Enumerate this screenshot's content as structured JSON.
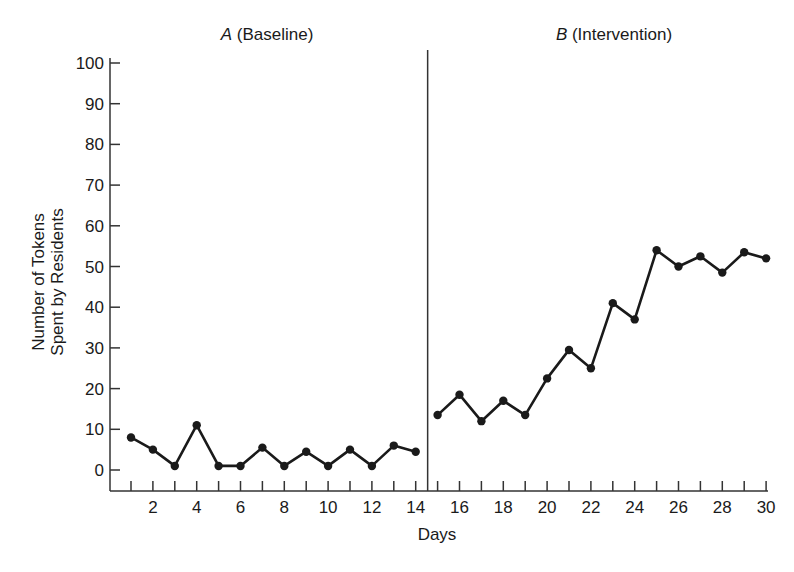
{
  "chart_data": {
    "type": "line",
    "title": "",
    "xlabel": "Days",
    "ylabel": "Number of Tokens Spent by Residents",
    "ylabel_lines": [
      "Number of Tokens",
      "Spent by Residents"
    ],
    "ylim": [
      0,
      100
    ],
    "xlim": [
      0,
      30
    ],
    "yticks": [
      0,
      10,
      20,
      30,
      40,
      50,
      60,
      70,
      80,
      90,
      100
    ],
    "xticks": [
      2,
      4,
      6,
      8,
      10,
      12,
      14,
      16,
      18,
      20,
      22,
      24,
      26,
      28,
      30
    ],
    "grid": false,
    "legend": "none",
    "phase_change_after_day": 14.5,
    "phases": [
      {
        "label_letter": "A",
        "label_text": "(Baseline)",
        "days": [
          1,
          2,
          3,
          4,
          5,
          6,
          7,
          8,
          9,
          10,
          11,
          12,
          13,
          14
        ],
        "values": [
          8,
          5,
          1,
          11,
          1,
          1,
          5.5,
          1,
          4.5,
          1,
          5,
          1,
          6,
          4.5
        ]
      },
      {
        "label_letter": "B",
        "label_text": "(Intervention)",
        "days": [
          15,
          16,
          17,
          18,
          19,
          20,
          21,
          22,
          23,
          24,
          25,
          26,
          27,
          28,
          29,
          30
        ],
        "values": [
          13.5,
          18.5,
          12,
          17,
          13.5,
          22.5,
          29.5,
          25,
          41,
          37,
          54,
          50,
          52.5,
          48.5,
          53.5,
          52
        ]
      }
    ],
    "series": [
      {
        "name": "A (Baseline)",
        "x": [
          1,
          2,
          3,
          4,
          5,
          6,
          7,
          8,
          9,
          10,
          11,
          12,
          13,
          14
        ],
        "values": [
          8,
          5,
          1,
          11,
          1,
          1,
          5.5,
          1,
          4.5,
          1,
          5,
          1,
          6,
          4.5
        ]
      },
      {
        "name": "B (Intervention)",
        "x": [
          15,
          16,
          17,
          18,
          19,
          20,
          21,
          22,
          23,
          24,
          25,
          26,
          27,
          28,
          29,
          30
        ],
        "values": [
          13.5,
          18.5,
          12,
          17,
          13.5,
          22.5,
          29.5,
          25,
          41,
          37,
          54,
          50,
          52.5,
          48.5,
          53.5,
          52
        ]
      }
    ]
  },
  "colors": {
    "line": "#1a1a1a",
    "axis": "#333333",
    "background": "#ffffff"
  }
}
